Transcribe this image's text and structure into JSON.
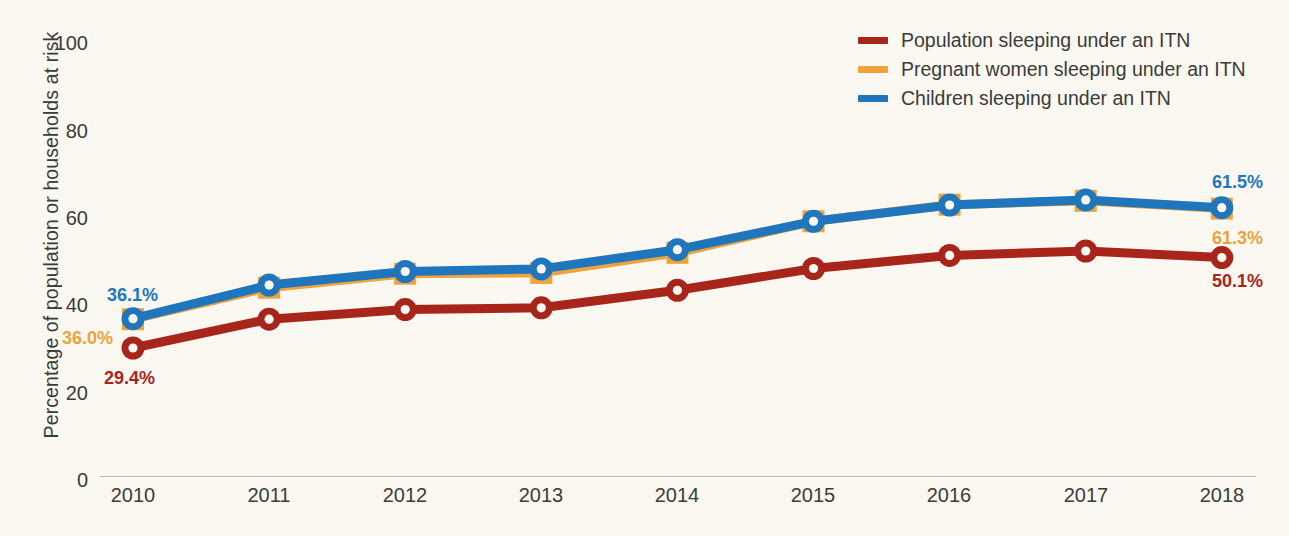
{
  "chart_data": {
    "type": "line",
    "title": "",
    "subtitle": "",
    "xlabel": "",
    "ylabel": "Percentage of population or households at risk",
    "categories": [
      "2010",
      "2011",
      "2012",
      "2013",
      "2014",
      "2015",
      "2016",
      "2017",
      "2018"
    ],
    "x": [
      2010,
      2011,
      2012,
      2013,
      2014,
      2015,
      2016,
      2017,
      2018
    ],
    "ylim": [
      0,
      100
    ],
    "yticks": [
      0,
      20,
      40,
      60,
      80,
      100
    ],
    "ytick_labels": [
      "0",
      "20",
      "40",
      "60",
      "80",
      "100"
    ],
    "grid": false,
    "legend_position": "top-right",
    "series": [
      {
        "name": "Population sleeping under an ITN",
        "color": "#a8251c",
        "marker": "circle",
        "values": [
          29.4,
          36.0,
          38.2,
          38.6,
          42.6,
          47.6,
          50.6,
          51.6,
          50.1
        ],
        "start_label": "29.4%",
        "end_label": "50.1%"
      },
      {
        "name": "Pregnant women sleeping under an ITN",
        "color": "#f0a23c",
        "marker": "square",
        "values": [
          36.0,
          43.2,
          46.4,
          46.6,
          51.2,
          58.4,
          62.2,
          63.1,
          61.3
        ],
        "start_label": "36.0%",
        "end_label": "61.3%"
      },
      {
        "name": "Children sleeping under an ITN",
        "color": "#1f76bd",
        "marker": "circle",
        "values": [
          36.1,
          43.8,
          46.9,
          47.5,
          51.9,
          58.4,
          62.1,
          63.3,
          61.5
        ],
        "start_label": "36.1%",
        "end_label": "61.5%"
      }
    ]
  },
  "axes": {
    "y_title": "Percentage of population or households at risk",
    "y_ticks": [
      "100",
      "80",
      "60",
      "40",
      "20",
      "0"
    ],
    "x_ticks": [
      "2010",
      "2011",
      "2012",
      "2013",
      "2014",
      "2015",
      "2016",
      "2017",
      "2018"
    ]
  },
  "legend": {
    "items": [
      {
        "label": "Population sleeping under an ITN",
        "color": "#a8251c"
      },
      {
        "label": "Pregnant women sleeping under an ITN",
        "color": "#f0a23c"
      },
      {
        "label": "Children sleeping under an ITN",
        "color": "#1f76bd"
      }
    ]
  },
  "point_labels": {
    "left": [
      {
        "text": "36.1%",
        "color": "#1f76bd"
      },
      {
        "text": "36.0%",
        "color": "#e8a33d"
      },
      {
        "text": "29.4%",
        "color": "#a8251c"
      }
    ],
    "right": [
      {
        "text": "61.5%",
        "color": "#1f76bd"
      },
      {
        "text": "61.3%",
        "color": "#e8a33d"
      },
      {
        "text": "50.1%",
        "color": "#a8251c"
      }
    ]
  },
  "colors": {
    "background": "#faf8f0",
    "red": "#a8251c",
    "orange": "#f0a23c",
    "blue": "#1f76bd",
    "axis": "#bdbab0",
    "text": "#3b3b3b"
  }
}
